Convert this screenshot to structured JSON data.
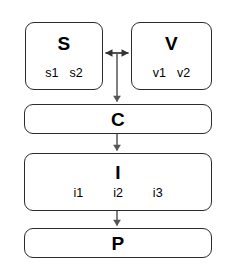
{
  "diagram": {
    "type": "flowchart",
    "nodes": [
      {
        "id": "s",
        "title": "S",
        "sublabels": [
          "s1",
          "s2"
        ]
      },
      {
        "id": "v",
        "title": "V",
        "sublabels": [
          "v1",
          "v2"
        ]
      },
      {
        "id": "c",
        "title": "C",
        "sublabels": []
      },
      {
        "id": "i",
        "title": "I",
        "sublabels": [
          "i1",
          "i2",
          "i3"
        ]
      },
      {
        "id": "p",
        "title": "P",
        "sublabels": []
      }
    ],
    "edges": [
      {
        "id": "s-v",
        "from": "S",
        "to": "V",
        "style": "bidirectional"
      },
      {
        "id": "sv-c",
        "from": "S/V",
        "to": "C",
        "style": "arrow-down"
      },
      {
        "id": "c-i",
        "from": "C",
        "to": "I",
        "style": "arrow-down"
      },
      {
        "id": "i-p",
        "from": "I",
        "to": "P",
        "style": "arrow-down"
      }
    ],
    "colors": {
      "stroke": "#2b2b2b",
      "connector": "#55555a",
      "fill": "#ffffff",
      "text": "#000000"
    }
  }
}
